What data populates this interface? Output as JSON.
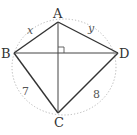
{
  "diagram": {
    "type": "cyclic-quadrilateral",
    "colors": {
      "line": "#333333",
      "circle": "#aaaaaa",
      "text": "#333333"
    },
    "vertices": {
      "A": {
        "label": "A",
        "x": 58,
        "y": 22
      },
      "B": {
        "label": "B",
        "x": 14,
        "y": 53
      },
      "C": {
        "label": "C",
        "x": 58,
        "y": 113
      },
      "D": {
        "label": "D",
        "x": 118,
        "y": 53
      }
    },
    "sides": {
      "AB": {
        "label": "x"
      },
      "AD": {
        "label": "y"
      },
      "BC": {
        "label": "7"
      },
      "CD": {
        "label": "8"
      }
    },
    "diagonals": [
      "AC",
      "BD"
    ],
    "right_angle_at": "intersection of AC and BD",
    "circle": {
      "style": "dotted",
      "note": "circumscribed circle"
    }
  }
}
